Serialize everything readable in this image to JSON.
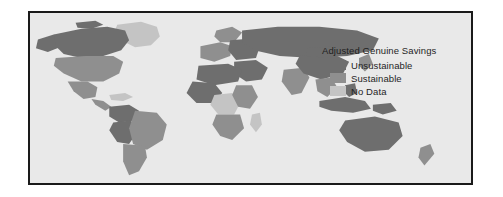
{
  "figure": {
    "background_color": "#ffffff",
    "frame_color": "#1a1a1a",
    "ocean_color": "#e9e9e9"
  },
  "legend": {
    "title": "Adjusted Genuine Savings",
    "items": [
      {
        "label": "Unsustainable",
        "color": "#6e6e6e"
      },
      {
        "label": "Sustainable",
        "color": "#8f8f8f"
      },
      {
        "label": "No Data",
        "color": "#c4c4c4"
      }
    ]
  },
  "map": {
    "type": "choropleth",
    "projection": "equirectangular",
    "classes": {
      "unsustainable": "#6e6e6e",
      "sustainable": "#8f8f8f",
      "no_data": "#c4c4c4"
    },
    "regions": [
      {
        "name": "greenland",
        "class": "no_data"
      },
      {
        "name": "canada",
        "class": "unsustainable"
      },
      {
        "name": "alaska",
        "class": "unsustainable"
      },
      {
        "name": "united-states",
        "class": "sustainable"
      },
      {
        "name": "mexico",
        "class": "sustainable"
      },
      {
        "name": "central-america",
        "class": "sustainable"
      },
      {
        "name": "caribbean",
        "class": "no_data"
      },
      {
        "name": "venezuela-colombia",
        "class": "unsustainable"
      },
      {
        "name": "brazil",
        "class": "sustainable"
      },
      {
        "name": "peru-bolivia",
        "class": "unsustainable"
      },
      {
        "name": "argentina-chile",
        "class": "sustainable"
      },
      {
        "name": "western-europe",
        "class": "sustainable"
      },
      {
        "name": "scandinavia",
        "class": "sustainable"
      },
      {
        "name": "eastern-europe",
        "class": "unsustainable"
      },
      {
        "name": "russia",
        "class": "unsustainable"
      },
      {
        "name": "north-africa",
        "class": "unsustainable"
      },
      {
        "name": "west-africa",
        "class": "unsustainable"
      },
      {
        "name": "central-africa",
        "class": "no_data"
      },
      {
        "name": "east-africa",
        "class": "sustainable"
      },
      {
        "name": "southern-africa",
        "class": "sustainable"
      },
      {
        "name": "madagascar",
        "class": "no_data"
      },
      {
        "name": "middle-east",
        "class": "unsustainable"
      },
      {
        "name": "india",
        "class": "sustainable"
      },
      {
        "name": "china",
        "class": "unsustainable"
      },
      {
        "name": "mongolia",
        "class": "unsustainable"
      },
      {
        "name": "southeast-asia",
        "class": "sustainable"
      },
      {
        "name": "indonesia",
        "class": "unsustainable"
      },
      {
        "name": "japan",
        "class": "sustainable"
      },
      {
        "name": "australia",
        "class": "unsustainable"
      },
      {
        "name": "new-zealand",
        "class": "sustainable"
      }
    ]
  }
}
